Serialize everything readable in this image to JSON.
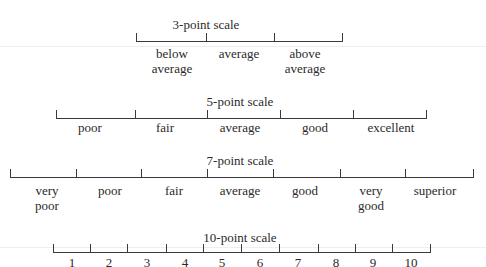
{
  "scales": [
    {
      "title": "3-point scale",
      "title_x": 206,
      "title_y": 17,
      "line_y": 41,
      "ticks": [
        136,
        206,
        274,
        342
      ],
      "labels": [
        {
          "text": "below\naverage",
          "x": 172,
          "y": 46
        },
        {
          "text": "average",
          "x": 239,
          "y": 46
        },
        {
          "text": "above\naverage",
          "x": 305,
          "y": 46
        }
      ]
    },
    {
      "title": "5-point scale",
      "title_x": 240,
      "title_y": 94,
      "line_y": 118,
      "ticks": [
        56,
        135,
        207,
        280,
        353,
        426
      ],
      "labels": [
        {
          "text": "poor",
          "x": 90,
          "y": 120
        },
        {
          "text": "fair",
          "x": 165,
          "y": 120
        },
        {
          "text": "average",
          "x": 240,
          "y": 120
        },
        {
          "text": "good",
          "x": 315,
          "y": 120
        },
        {
          "text": "excellent",
          "x": 391,
          "y": 120
        }
      ]
    },
    {
      "title": "7-point scale",
      "title_x": 240,
      "title_y": 153,
      "line_y": 177,
      "ticks": [
        10,
        76,
        141,
        207,
        273,
        340,
        405,
        473
      ],
      "labels": [
        {
          "text": "very\npoor",
          "x": 47,
          "y": 183
        },
        {
          "text": "poor",
          "x": 110,
          "y": 183
        },
        {
          "text": "fair",
          "x": 174,
          "y": 183
        },
        {
          "text": "average",
          "x": 240,
          "y": 183
        },
        {
          "text": "good",
          "x": 305,
          "y": 183
        },
        {
          "text": "very\ngood",
          "x": 371,
          "y": 183
        },
        {
          "text": "superior",
          "x": 435,
          "y": 183
        }
      ]
    },
    {
      "title": "10-point scale",
      "title_x": 240,
      "title_y": 230,
      "line_y": 252,
      "ticks": [
        53,
        90,
        127,
        166,
        203,
        241,
        279,
        318,
        355,
        392,
        430
      ],
      "labels": [
        {
          "text": "1",
          "x": 72,
          "y": 255
        },
        {
          "text": "2",
          "x": 109,
          "y": 255
        },
        {
          "text": "3",
          "x": 147,
          "y": 255
        },
        {
          "text": "4",
          "x": 185,
          "y": 255
        },
        {
          "text": "5",
          "x": 222,
          "y": 255
        },
        {
          "text": "6",
          "x": 260,
          "y": 255
        },
        {
          "text": "7",
          "x": 298,
          "y": 255
        },
        {
          "text": "8",
          "x": 336,
          "y": 255
        },
        {
          "text": "9",
          "x": 373,
          "y": 255
        },
        {
          "text": "10",
          "x": 411,
          "y": 255
        }
      ]
    }
  ]
}
